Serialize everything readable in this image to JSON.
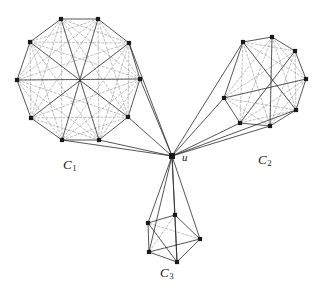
{
  "figure": {
    "type": "graph-diagram",
    "background_color": "#ffffff",
    "stroke_color": "#2b2b2b",
    "dashed_color": "#8a8a8a",
    "vertex_color": "#1a1a1a"
  },
  "labels": {
    "c1": {
      "base": "C",
      "sub": "1"
    },
    "c2": {
      "base": "C",
      "sub": "2"
    },
    "c3": {
      "base": "C",
      "sub": "3"
    },
    "u": "u"
  },
  "chart_data": {
    "type": "scatter",
    "title": "",
    "xlabel": "",
    "ylabel": "",
    "hub": {
      "id": "u",
      "x": 172,
      "y": 156,
      "label": "u"
    },
    "clusters": [
      {
        "name": "C1",
        "label_position": {
          "x": 63,
          "y": 157
        },
        "vertex_count": 10,
        "vertices": [
          {
            "id": "a1",
            "x": 61,
            "y": 19
          },
          {
            "id": "a2",
            "x": 98,
            "y": 19
          },
          {
            "id": "a3",
            "x": 129,
            "y": 43
          },
          {
            "id": "a4",
            "x": 140,
            "y": 79
          },
          {
            "id": "a5",
            "x": 128,
            "y": 117
          },
          {
            "id": "a6",
            "x": 99,
            "y": 140
          },
          {
            "id": "a7",
            "x": 62,
            "y": 140
          },
          {
            "id": "a8",
            "x": 31,
            "y": 118
          },
          {
            "id": "a9",
            "x": 17,
            "y": 80
          },
          {
            "id": "a10",
            "x": 30,
            "y": 42
          }
        ],
        "hub_connected": [
          "a3",
          "a4",
          "a5",
          "a6",
          "a7"
        ]
      },
      {
        "name": "C2",
        "label_position": {
          "x": 258,
          "y": 152
        },
        "vertex_count": 8,
        "vertices": [
          {
            "id": "b1",
            "x": 243,
            "y": 42
          },
          {
            "id": "b2",
            "x": 272,
            "y": 37
          },
          {
            "id": "b3",
            "x": 295,
            "y": 51
          },
          {
            "id": "b4",
            "x": 306,
            "y": 79
          },
          {
            "id": "b5",
            "x": 296,
            "y": 110
          },
          {
            "id": "b6",
            "x": 270,
            "y": 126
          },
          {
            "id": "b7",
            "x": 240,
            "y": 123
          },
          {
            "id": "b8",
            "x": 224,
            "y": 98
          }
        ],
        "hub_connected": [
          "b1",
          "b6",
          "b7",
          "b8",
          "b5"
        ]
      },
      {
        "name": "C3",
        "label_position": {
          "x": 160,
          "y": 265
        },
        "vertex_count": 5,
        "vertices": [
          {
            "id": "c1",
            "x": 175,
            "y": 215
          },
          {
            "id": "c2",
            "x": 200,
            "y": 239
          },
          {
            "id": "c3",
            "x": 177,
            "y": 262
          },
          {
            "id": "c4",
            "x": 149,
            "y": 252
          },
          {
            "id": "c5",
            "x": 148,
            "y": 223
          }
        ],
        "hub_connected": [
          "c1",
          "c2",
          "c3",
          "c4",
          "c5"
        ]
      }
    ]
  }
}
